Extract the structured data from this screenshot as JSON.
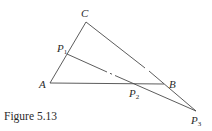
{
  "figure": {
    "caption": "Figure 5.13",
    "points": {
      "C": {
        "label": "C",
        "x": 86,
        "y": 22
      },
      "A": {
        "label": "A",
        "x": 50,
        "y": 83
      },
      "B": {
        "label": "B",
        "x": 164,
        "y": 84
      },
      "P1": {
        "label": "P",
        "sub": "1",
        "x": 67,
        "y": 54
      },
      "P2": {
        "label": "P",
        "sub": "2",
        "x": 135,
        "y": 84
      },
      "P3": {
        "label": "P",
        "sub": "3",
        "x": 196,
        "y": 111
      }
    },
    "segments": [
      [
        "C",
        "A"
      ],
      [
        "A",
        "B"
      ],
      [
        "C",
        "P3"
      ],
      [
        "P1",
        "P3"
      ]
    ]
  }
}
